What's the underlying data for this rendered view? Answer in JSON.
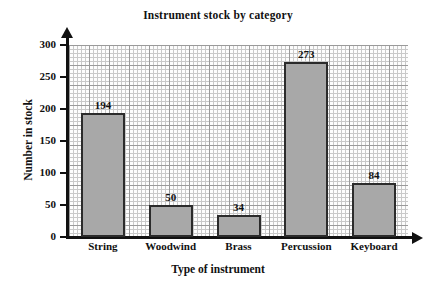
{
  "chart_data": {
    "type": "bar",
    "title": "Instrument stock by category",
    "xlabel": "Type of instrument",
    "ylabel": "Number in stock",
    "categories": [
      "String",
      "Woodwind",
      "Brass",
      "Percussion",
      "Keyboard"
    ],
    "values": [
      194,
      50,
      34,
      273,
      84
    ],
    "value_labels": [
      "194",
      "50",
      "34",
      "273",
      "84"
    ],
    "ylim": [
      0,
      300
    ],
    "yticks": [
      0,
      50,
      100,
      150,
      200,
      250,
      300
    ],
    "ytick_labels": [
      "0",
      "50",
      "100",
      "150",
      "200",
      "250",
      "300"
    ],
    "grid": "graph-paper",
    "legend": "none",
    "bar_color": "#a8a8a8",
    "bar_edge_color": "#2b2b2b",
    "axis_color": "#111111",
    "background": "#ffffff"
  }
}
